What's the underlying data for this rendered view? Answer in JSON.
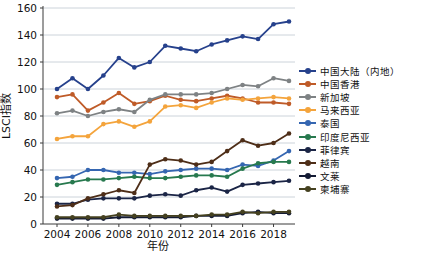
{
  "chart_data": {
    "type": "line",
    "title": "",
    "xlabel": "年份",
    "ylabel": "LSCI指数",
    "x": [
      2004,
      2005,
      2006,
      2007,
      2008,
      2009,
      2010,
      2011,
      2012,
      2013,
      2014,
      2015,
      2016,
      2017,
      2018,
      2019
    ],
    "x_tick_labels": [
      "2004",
      "2006",
      "2008",
      "2010",
      "2012",
      "2014",
      "2016",
      "2018"
    ],
    "y_ticks": [
      0,
      20,
      40,
      60,
      80,
      100,
      120,
      140,
      160
    ],
    "ylim": [
      0,
      160
    ],
    "grid": "horizontal",
    "legend_position": "right",
    "marker": "circle",
    "series": [
      {
        "name": "中国大陆（内地）",
        "color": "#26418C",
        "values": [
          100,
          108,
          100,
          110,
          123,
          116,
          120,
          132,
          130,
          128,
          133,
          136,
          139,
          137,
          148,
          150
        ]
      },
      {
        "name": "中国香港",
        "color": "#BF5B28",
        "values": [
          94,
          96,
          84,
          90,
          97,
          89,
          91,
          95,
          92,
          91,
          93,
          95,
          93,
          90,
          90,
          89
        ]
      },
      {
        "name": "新加坡",
        "color": "#7E8284",
        "values": [
          82,
          84,
          80,
          83,
          85,
          83,
          92,
          96,
          96,
          96,
          97,
          100,
          103,
          102,
          108,
          106
        ]
      },
      {
        "name": "马来西亚",
        "color": "#F4A43C",
        "values": [
          63,
          65,
          65,
          74,
          76,
          72,
          76,
          87,
          88,
          86,
          90,
          93,
          92,
          93,
          94,
          93
        ]
      },
      {
        "name": "泰国",
        "color": "#3566B1",
        "values": [
          34,
          35,
          40,
          40,
          38,
          38,
          37,
          39,
          40,
          41,
          41,
          40,
          44,
          43,
          47,
          54
        ]
      },
      {
        "name": "印度尼西亚",
        "color": "#27794E",
        "values": [
          29,
          31,
          33,
          33,
          34,
          35,
          34,
          34,
          35,
          36,
          36,
          35,
          41,
          45,
          46,
          46
        ]
      },
      {
        "name": "菲律宾",
        "color": "#1B2546",
        "values": [
          15,
          15,
          18,
          19,
          19,
          19,
          21,
          22,
          21,
          25,
          27,
          24,
          29,
          30,
          31,
          32
        ]
      },
      {
        "name": "越南",
        "color": "#4E2E18",
        "values": [
          13,
          14,
          19,
          22,
          25,
          23,
          44,
          48,
          47,
          44,
          46,
          54,
          62,
          58,
          60,
          67
        ]
      },
      {
        "name": "文莱",
        "color": "#141B34",
        "values": [
          4,
          4,
          4,
          4,
          5,
          5,
          5,
          5,
          5,
          6,
          6,
          6,
          8,
          9,
          8,
          8
        ]
      },
      {
        "name": "柬埔寨",
        "color": "#454120",
        "values": [
          5,
          5,
          5,
          5,
          7,
          6,
          6,
          6,
          6,
          6,
          7,
          7,
          9,
          8,
          9,
          9
        ]
      }
    ]
  }
}
